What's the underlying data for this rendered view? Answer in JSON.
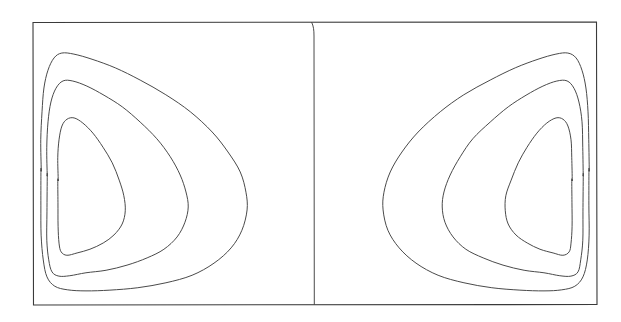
{
  "figure": {
    "title": "",
    "background_color": "#ffffff",
    "line_color": "#4a4a4a",
    "frame_color": "#3a3a3a",
    "width_px": 621,
    "height_px": 322
  },
  "chart_data": {
    "type": "line",
    "subtype": "contour",
    "title": "",
    "subtitle": "",
    "xlabel": "",
    "ylabel": "",
    "grid": false,
    "legend": null,
    "annotations": [],
    "axis_ticks": {
      "x": [],
      "y": []
    },
    "panel_count": 2,
    "contour_levels_per_panel": 3,
    "frame": {
      "x0": 33,
      "y0": 22,
      "x1": 597,
      "y1": 305
    },
    "divider_x": 314,
    "panels": [
      {
        "name": "left-panel",
        "mirrored": false,
        "bounds": {
          "x0": 33,
          "y0": 22,
          "x1": 314,
          "y1": 305
        },
        "contours": [
          {
            "level_index": 1,
            "label": "outer",
            "points": [
              [
                41,
                170
              ],
              [
                41,
                140
              ],
              [
                42,
                112
              ],
              [
                44,
                88
              ],
              [
                48,
                70
              ],
              [
                54,
                58
              ],
              [
                62,
                53
              ],
              [
                74,
                54
              ],
              [
                92,
                59
              ],
              [
                115,
                68
              ],
              [
                140,
                80
              ],
              [
                166,
                95
              ],
              [
                190,
                112
              ],
              [
                212,
                132
              ],
              [
                228,
                152
              ],
              [
                240,
                172
              ],
              [
                246,
                192
              ],
              [
                247,
                210
              ],
              [
                242,
                230
              ],
              [
                231,
                248
              ],
              [
                214,
                263
              ],
              [
                192,
                275
              ],
              [
                166,
                283
              ],
              [
                138,
                288
              ],
              [
                110,
                290
              ],
              [
                86,
                291
              ],
              [
                68,
                290
              ],
              [
                55,
                286
              ],
              [
                47,
                277
              ],
              [
                43,
                260
              ],
              [
                41,
                235
              ],
              [
                41,
                205
              ],
              [
                41,
                170
              ]
            ]
          },
          {
            "level_index": 2,
            "label": "middle",
            "points": [
              [
                47,
                175
              ],
              [
                47,
                148
              ],
              [
                48,
                122
              ],
              [
                51,
                102
              ],
              [
                56,
                88
              ],
              [
                63,
                81
              ],
              [
                73,
                81
              ],
              [
                87,
                86
              ],
              [
                104,
                95
              ],
              [
                122,
                107
              ],
              [
                140,
                122
              ],
              [
                157,
                139
              ],
              [
                170,
                157
              ],
              [
                180,
                175
              ],
              [
                186,
                192
              ],
              [
                188,
                207
              ],
              [
                185,
                222
              ],
              [
                177,
                237
              ],
              [
                164,
                249
              ],
              [
                147,
                258
              ],
              [
                127,
                265
              ],
              [
                106,
                270
              ],
              [
                86,
                273
              ],
              [
                70,
                276
              ],
              [
                59,
                276
              ],
              [
                52,
                272
              ],
              [
                49,
                260
              ],
              [
                47,
                240
              ],
              [
                47,
                212
              ],
              [
                47,
                175
              ]
            ]
          },
          {
            "level_index": 3,
            "label": "inner",
            "points": [
              [
                58,
                180
              ],
              [
                58,
                158
              ],
              [
                59,
                140
              ],
              [
                62,
                126
              ],
              [
                67,
                119
              ],
              [
                74,
                118
              ],
              [
                83,
                123
              ],
              [
                93,
                133
              ],
              [
                103,
                147
              ],
              [
                112,
                163
              ],
              [
                119,
                180
              ],
              [
                124,
                196
              ],
              [
                125,
                211
              ],
              [
                122,
                224
              ],
              [
                114,
                235
              ],
              [
                103,
                243
              ],
              [
                90,
                249
              ],
              [
                77,
                253
              ],
              [
                67,
                255
              ],
              [
                61,
                252
              ],
              [
                59,
                243
              ],
              [
                58,
                226
              ],
              [
                58,
                203
              ],
              [
                58,
                180
              ]
            ]
          }
        ]
      },
      {
        "name": "right-panel",
        "mirrored": true,
        "bounds": {
          "x0": 314,
          "y0": 22,
          "x1": 597,
          "y1": 305
        },
        "contours": [
          {
            "level_index": 1,
            "label": "outer",
            "points": [
              [
                589,
                170
              ],
              [
                589,
                140
              ],
              [
                588,
                112
              ],
              [
                586,
                88
              ],
              [
                582,
                70
              ],
              [
                576,
                58
              ],
              [
                568,
                53
              ],
              [
                556,
                54
              ],
              [
                538,
                59
              ],
              [
                515,
                68
              ],
              [
                490,
                80
              ],
              [
                464,
                95
              ],
              [
                440,
                112
              ],
              [
                418,
                132
              ],
              [
                402,
                152
              ],
              [
                390,
                172
              ],
              [
                384,
                192
              ],
              [
                383,
                210
              ],
              [
                388,
                230
              ],
              [
                399,
                248
              ],
              [
                416,
                263
              ],
              [
                438,
                275
              ],
              [
                464,
                283
              ],
              [
                492,
                288
              ],
              [
                520,
                290
              ],
              [
                544,
                291
              ],
              [
                562,
                290
              ],
              [
                575,
                286
              ],
              [
                583,
                277
              ],
              [
                587,
                260
              ],
              [
                589,
                235
              ],
              [
                589,
                205
              ],
              [
                589,
                170
              ]
            ]
          },
          {
            "level_index": 2,
            "label": "middle",
            "points": [
              [
                583,
                175
              ],
              [
                583,
                148
              ],
              [
                582,
                122
              ],
              [
                579,
                102
              ],
              [
                574,
                88
              ],
              [
                567,
                81
              ],
              [
                557,
                81
              ],
              [
                543,
                86
              ],
              [
                526,
                95
              ],
              [
                508,
                107
              ],
              [
                490,
                122
              ],
              [
                473,
                139
              ],
              [
                460,
                157
              ],
              [
                450,
                175
              ],
              [
                444,
                192
              ],
              [
                442,
                207
              ],
              [
                445,
                222
              ],
              [
                453,
                237
              ],
              [
                466,
                249
              ],
              [
                483,
                258
              ],
              [
                503,
                265
              ],
              [
                524,
                270
              ],
              [
                544,
                273
              ],
              [
                560,
                276
              ],
              [
                571,
                276
              ],
              [
                578,
                272
              ],
              [
                581,
                260
              ],
              [
                583,
                240
              ],
              [
                583,
                212
              ],
              [
                583,
                175
              ]
            ]
          },
          {
            "level_index": 3,
            "label": "inner",
            "points": [
              [
                572,
                180
              ],
              [
                572,
                158
              ],
              [
                571,
                140
              ],
              [
                568,
                126
              ],
              [
                563,
                119
              ],
              [
                556,
                118
              ],
              [
                547,
                123
              ],
              [
                537,
                133
              ],
              [
                527,
                147
              ],
              [
                518,
                163
              ],
              [
                511,
                180
              ],
              [
                506,
                196
              ],
              [
                505,
                211
              ],
              [
                508,
                224
              ],
              [
                516,
                235
              ],
              [
                527,
                243
              ],
              [
                540,
                249
              ],
              [
                553,
                253
              ],
              [
                563,
                255
              ],
              [
                569,
                252
              ],
              [
                571,
                243
              ],
              [
                572,
                226
              ],
              [
                572,
                203
              ],
              [
                572,
                180
              ]
            ]
          }
        ]
      }
    ]
  }
}
